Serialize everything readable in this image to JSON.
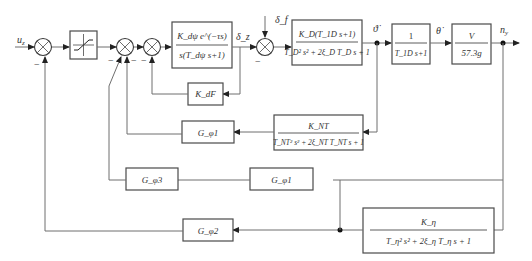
{
  "diagram": {
    "title": "",
    "input_label": "u_z",
    "output_label": "n_y",
    "signals": {
      "delta_z": "δ_z",
      "delta_f": "δ_f",
      "theta_dot_dot": "ϑ̇",
      "theta_dot": "θ̇",
      "n_y": "n_y"
    },
    "minus_sign": "−",
    "blocks": {
      "saturation": {
        "kind": "saturation"
      },
      "actuator": {
        "num": "K_dψ e^(−τs)",
        "den": "s(T_dψ s+1)"
      },
      "airframe": {
        "num": "K_D(T_1D s+1)",
        "den": "T_D² s² + 2ξ_D T_D s + 1"
      },
      "lag": {
        "num": "1",
        "den": "T_1D s+1"
      },
      "gain_v": {
        "num": "V",
        "den": "57.3g"
      },
      "k_feedback": {
        "label": "K_dF"
      },
      "gyro": {
        "num": "K_NT",
        "den": "T_NT² s² + 2ξ_NT T_NT s + 1"
      },
      "g_phi1": {
        "label": "G_φ1"
      },
      "g_phi3": {
        "label": "G_φ3"
      },
      "g_phi_mid": {
        "label": "G_φ1"
      },
      "accel": {
        "num": "K_η",
        "den": "T_η² s² + 2ξ_η T_η s + 1"
      },
      "g_phi2": {
        "label": "G_φ2"
      }
    }
  }
}
